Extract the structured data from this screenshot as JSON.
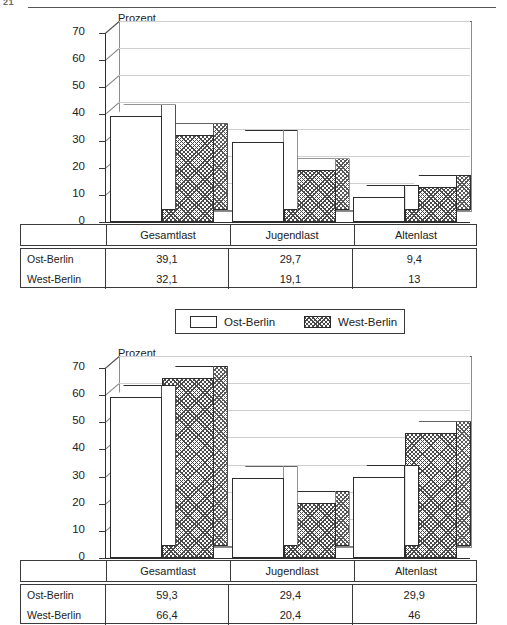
{
  "page": {
    "number": "21"
  },
  "legend": {
    "items": [
      {
        "label": "Ost-Berlin",
        "pattern": "solid-white"
      },
      {
        "label": "West-Berlin",
        "pattern": "hatched"
      }
    ]
  },
  "chart_data": [
    {
      "type": "bar",
      "title": "",
      "ylabel": "Prozent",
      "xlabel": "",
      "ylim": [
        0,
        70
      ],
      "yticks": [
        0,
        10,
        20,
        30,
        40,
        50,
        60,
        70
      ],
      "grid": true,
      "legend_position": "below",
      "categories": [
        "Gesamtlast",
        "Jugendlast",
        "Altenlast"
      ],
      "series": [
        {
          "name": "Ost-Berlin",
          "values": [
            39.1,
            29.7,
            9.4
          ],
          "labels": [
            "39,1",
            "29,7",
            "9,4"
          ]
        },
        {
          "name": "West-Berlin",
          "values": [
            32.1,
            19.1,
            13
          ],
          "labels": [
            "32,1",
            "19,1",
            "13"
          ]
        }
      ],
      "table": {
        "row_header": "",
        "columns": [
          "Gesamtlast",
          "Jugendlast",
          "Altenlast"
        ],
        "rows": [
          {
            "label": "Ost-Berlin",
            "values": [
              "39,1",
              "29,7",
              "9,4"
            ]
          },
          {
            "label": "West-Berlin",
            "values": [
              "32,1",
              "19,1",
              "13"
            ]
          }
        ]
      }
    },
    {
      "type": "bar",
      "title": "",
      "ylabel": "Prozent",
      "xlabel": "",
      "ylim": [
        0,
        70
      ],
      "yticks": [
        0,
        10,
        20,
        30,
        40,
        50,
        60,
        70
      ],
      "grid": true,
      "legend_position": "above",
      "categories": [
        "Gesamtlast",
        "Jugendlast",
        "Altenlast"
      ],
      "series": [
        {
          "name": "Ost-Berlin",
          "values": [
            59.3,
            29.4,
            29.9
          ],
          "labels": [
            "59,3",
            "29,4",
            "29,9"
          ]
        },
        {
          "name": "West-Berlin",
          "values": [
            66.4,
            20.4,
            46
          ],
          "labels": [
            "66,4",
            "20,4",
            "46"
          ]
        }
      ],
      "table": {
        "row_header": "",
        "columns": [
          "Gesamtlast",
          "Jugendlast",
          "Altenlast"
        ],
        "rows": [
          {
            "label": "Ost-Berlin",
            "values": [
              "59,3",
              "29,4",
              "29,9"
            ]
          },
          {
            "label": "West-Berlin",
            "values": [
              "66,4",
              "20,4",
              "46"
            ]
          }
        ]
      }
    }
  ]
}
